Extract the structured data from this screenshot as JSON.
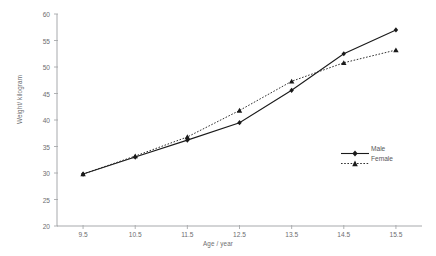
{
  "chart_data": {
    "type": "line",
    "title": "",
    "xlabel": "Age / year",
    "ylabel": "Weight/ kilogram",
    "x": [
      9.5,
      10.5,
      11.5,
      12.5,
      13.5,
      14.5,
      15.5
    ],
    "xtick_labels": [
      "9.5",
      "10.5",
      "11.5",
      "12.5",
      "13.5",
      "14.5",
      "15.5"
    ],
    "ytick_labels": [
      "60",
      "55",
      "50",
      "45",
      "40",
      "35",
      "30",
      "25",
      "20"
    ],
    "ytick_values": [
      60,
      55,
      50,
      45,
      40,
      35,
      30,
      25,
      20
    ],
    "xlim": [
      9.0,
      16.0
    ],
    "ylim": [
      20,
      60
    ],
    "grid": false,
    "legend_position": "right-middle",
    "series": [
      {
        "name": "Male",
        "values": [
          29.8,
          33.0,
          36.2,
          39.5,
          45.6,
          52.5,
          57.0
        ],
        "line_style": "solid",
        "marker": "diamond",
        "color": "#1a1a1a"
      },
      {
        "name": "Female",
        "values": [
          29.8,
          33.2,
          36.8,
          41.8,
          47.3,
          50.8,
          53.2
        ],
        "line_style": "dotted",
        "marker": "triangle",
        "color": "#1a1a1a"
      }
    ]
  },
  "legend": {
    "male_label": "Male",
    "female_label": "Female"
  },
  "axes": {
    "y_title": "Weight/ kilogram",
    "x_title": "Age / year"
  },
  "caption": {
    "text": ""
  },
  "colors": {
    "axis": "#a7a9ac",
    "tick_text": "#6d6e70",
    "series": "#1a1a1a"
  }
}
